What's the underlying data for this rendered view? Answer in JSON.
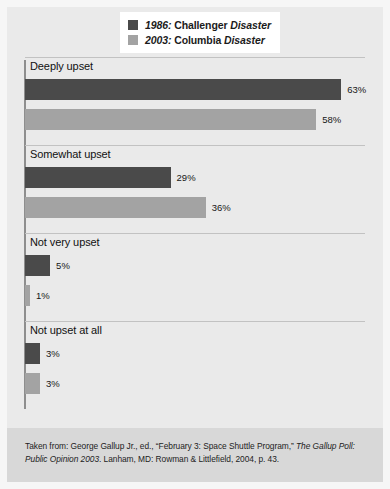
{
  "chart_data": {
    "type": "bar",
    "orientation": "horizontal",
    "title": "",
    "subtitle": "",
    "xlabel": "",
    "ylabel": "",
    "categories": [
      "Deeply upset",
      "Somewhat upset",
      "Not very upset",
      "Not upset at all"
    ],
    "series": [
      {
        "name": "1986: Challenger Disaster",
        "year": "1986",
        "event": "Challenger",
        "event_suffix": "Disaster",
        "color": "#4a4a4a",
        "values": [
          63,
          58,
          5,
          3
        ],
        "value_labels": [
          "63%",
          "29%",
          "5%",
          "3%"
        ]
      },
      {
        "name": "2003: Columbia Disaster",
        "year": "2003",
        "event": "Columbia",
        "event_suffix": "Disaster",
        "color": "#a3a3a3",
        "values": [
          58,
          36,
          1,
          3
        ],
        "value_labels": [
          "58%",
          "36%",
          "1%",
          "3%"
        ]
      }
    ],
    "points": [
      {
        "category": "Deeply upset",
        "challenger": 63,
        "columbia": 58
      },
      {
        "category": "Somewhat upset",
        "challenger": 29,
        "columbia": 36
      },
      {
        "category": "Not very upset",
        "challenger": 5,
        "columbia": 1
      },
      {
        "category": "Not upset at all",
        "challenger": 3,
        "columbia": 3
      }
    ],
    "xlim": [
      0,
      70
    ],
    "grid": false,
    "legend_position": "top-center",
    "units": "percent"
  },
  "legend": {
    "items": [
      {
        "year": "1986:",
        "label": " Challenger ",
        "emphasis": "Disaster",
        "swatch": "dark"
      },
      {
        "year": "2003:",
        "label": " Columbia ",
        "emphasis": "Disaster",
        "swatch": "light"
      }
    ]
  },
  "groups": [
    {
      "label": "Deeply upset",
      "bars": [
        {
          "value": 63,
          "value_label": "63%",
          "series": "1986: Challenger Disaster",
          "tone": "dark"
        },
        {
          "value": 58,
          "value_label": "58%",
          "series": "2003: Columbia Disaster",
          "tone": "light"
        }
      ]
    },
    {
      "label": "Somewhat upset",
      "bars": [
        {
          "value": 29,
          "value_label": "29%",
          "series": "1986: Challenger Disaster",
          "tone": "dark"
        },
        {
          "value": 36,
          "value_label": "36%",
          "series": "2003: Columbia Disaster",
          "tone": "light"
        }
      ]
    },
    {
      "label": "Not very upset",
      "bars": [
        {
          "value": 5,
          "value_label": "5%",
          "series": "1986: Challenger Disaster",
          "tone": "dark"
        },
        {
          "value": 1,
          "value_label": "1%",
          "series": "2003: Columbia Disaster",
          "tone": "light"
        }
      ]
    },
    {
      "label": "Not upset at all",
      "bars": [
        {
          "value": 3,
          "value_label": "3%",
          "series": "1986: Challenger Disaster",
          "tone": "dark"
        },
        {
          "value": 3,
          "value_label": "3%",
          "series": "2003: Columbia Disaster",
          "tone": "light"
        }
      ]
    }
  ],
  "source": {
    "prefix": "Taken from: George Gallup Jr., ed., “February 3: Space Shuttle Program,” ",
    "italic_title": "The Gallup Poll: Public Opinion 2003",
    "suffix": ". Lanham, MD: Rowman & Littlefield, 2004, p. 43."
  },
  "colors": {
    "series_1986": "#4a4a4a",
    "series_2003": "#a3a3a3",
    "panel_background": "#eaeaea",
    "source_band": "#d8d8d8",
    "axis": "#8e8e8e"
  }
}
